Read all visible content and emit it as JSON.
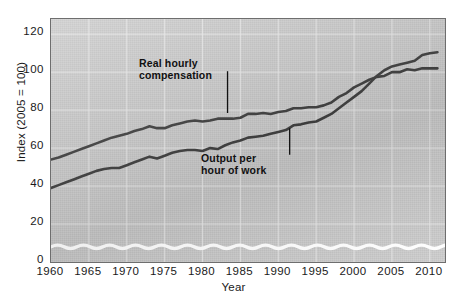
{
  "chart_data": {
    "type": "line",
    "title": "",
    "xlabel": "Year",
    "ylabel": "Index (2005 = 100)",
    "xlim": [
      1960,
      2012
    ],
    "ylim": [
      0,
      128
    ],
    "yticks": [
      0,
      20,
      40,
      60,
      80,
      100,
      120
    ],
    "xticks": [
      1960,
      1965,
      1970,
      1975,
      1980,
      1985,
      1990,
      1995,
      2000,
      2005,
      2010
    ],
    "grid": true,
    "legend_position": "inline-annotations",
    "axis_break": "wavy white break near zero baseline",
    "x": [
      1960,
      1961,
      1962,
      1963,
      1964,
      1965,
      1966,
      1967,
      1968,
      1969,
      1970,
      1971,
      1972,
      1973,
      1974,
      1975,
      1976,
      1977,
      1978,
      1979,
      1980,
      1981,
      1982,
      1983,
      1984,
      1985,
      1986,
      1987,
      1988,
      1989,
      1990,
      1991,
      1992,
      1993,
      1994,
      1995,
      1996,
      1997,
      1998,
      1999,
      2000,
      2001,
      2002,
      2003,
      2004,
      2005,
      2006,
      2007,
      2008,
      2009,
      2010,
      2011
    ],
    "series": [
      {
        "name": "Real hourly compensation",
        "annotation": "Real hourly\ncompensation",
        "color": "#3a3a3a",
        "values": [
          54,
          55,
          56.5,
          58,
          59.5,
          61,
          62.5,
          64,
          65.5,
          66.5,
          67.5,
          69,
          70,
          71.5,
          70.5,
          70.5,
          72,
          73,
          74,
          74.5,
          74,
          74.5,
          75.5,
          75.5,
          75.5,
          76,
          78,
          78,
          78.5,
          78,
          79,
          79.5,
          81,
          81,
          81.5,
          81.5,
          82.5,
          84,
          87,
          89,
          92,
          94,
          96,
          97.5,
          98,
          100,
          100,
          101.5,
          101,
          102,
          102,
          102
        ]
      },
      {
        "name": "Output per hour of work",
        "annotation": "Output per\nhour of work",
        "color": "#3a3a3a",
        "values": [
          39,
          40.5,
          42,
          43.5,
          45,
          46.5,
          48,
          49,
          49.5,
          49.5,
          51,
          52.5,
          54,
          55.5,
          54.5,
          56,
          57.5,
          58.5,
          59,
          59,
          58.5,
          60,
          59.5,
          61.5,
          63,
          64,
          65.5,
          66,
          66.5,
          67.5,
          68.5,
          69.5,
          72,
          72.5,
          73.5,
          74,
          76,
          78,
          81,
          84,
          87,
          90,
          94,
          98,
          101,
          103,
          104,
          105,
          106,
          109,
          110,
          110.5
        ]
      }
    ]
  },
  "axes": {
    "y_title": "Index (2005 = 100)",
    "x_title": "Year",
    "y_tick_labels": [
      "120",
      "100",
      "80",
      "60",
      "40",
      "20",
      "0"
    ],
    "x_tick_labels": [
      "1960",
      "1965",
      "1970",
      "1975",
      "1980",
      "1985",
      "1990",
      "1995",
      "2000",
      "2005",
      "2010"
    ]
  },
  "annotations": {
    "compensation": "Real hourly\ncompensation",
    "output": "Output per\nhour of work"
  },
  "colors": {
    "plot_background": "#c9c9c9",
    "line": "#3a3a3a",
    "grid": "#e8e8e8",
    "frame": "#6e6e6e",
    "text": "#1a1a1a",
    "break_line": "#ffffff"
  }
}
